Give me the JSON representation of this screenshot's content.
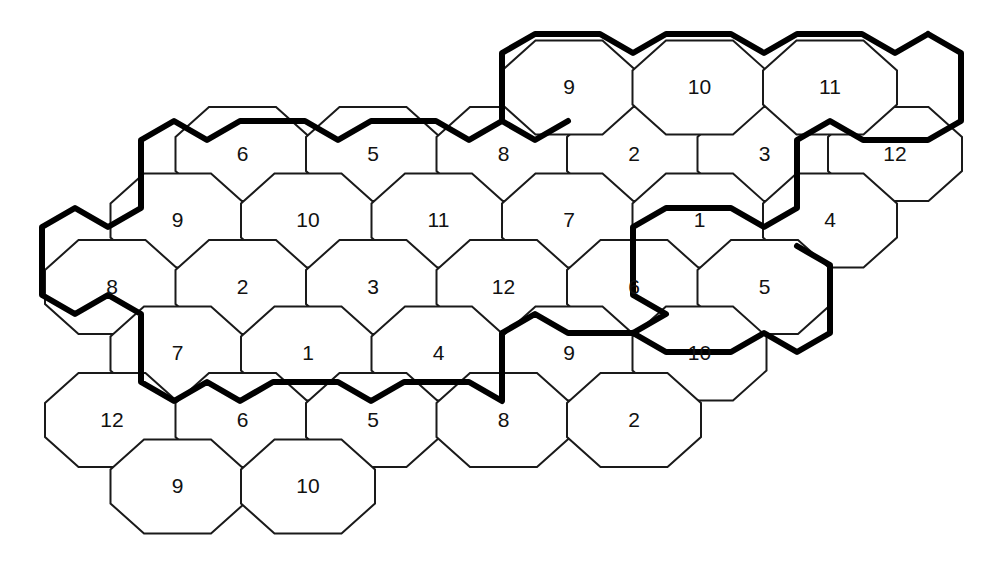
{
  "figure": {
    "name": "hexagonal-cell-grid",
    "background_color": "#ffffff",
    "thin_line_color": "#1a1a1a",
    "thick_line_color": "#000000",
    "label_color": "#111111",
    "thin_line_width": 2.0,
    "thick_line_width": 6.0,
    "hex": {
      "half_width": 67,
      "half_height": 47,
      "side_half_height": 17,
      "column_pitch": 130.5,
      "row_pitch": 133,
      "column_offset": 66.5
    },
    "origin": {
      "x": 112,
      "y": 287
    }
  },
  "cells": [
    {
      "id": "c-r0-q2",
      "label": "6",
      "col": 1,
      "row": -1,
      "cx": 242.5,
      "cy": 154.0
    },
    {
      "id": "c-r0-q3",
      "label": "5",
      "col": 2,
      "row": -1,
      "cx": 373.0,
      "cy": 154.0
    },
    {
      "id": "c-r0-q4",
      "label": "8",
      "col": 3,
      "row": -1,
      "cx": 503.5,
      "cy": 154.0
    },
    {
      "id": "c-r0-q5",
      "label": "2",
      "col": 4,
      "row": -1,
      "cx": 634.0,
      "cy": 154.0
    },
    {
      "id": "c-r0-q6",
      "label": "3",
      "col": 5,
      "row": -1,
      "cx": 764.5,
      "cy": 154.0
    },
    {
      "id": "c-r0-q7",
      "label": "12",
      "col": 6,
      "row": -1,
      "cx": 895.0,
      "cy": 154.0
    },
    {
      "id": "c-t-q4",
      "label": "9",
      "col": 3,
      "row": -2,
      "cx": 569.0,
      "cy": 87.5
    },
    {
      "id": "c-t-q5",
      "label": "10",
      "col": 4,
      "row": -2,
      "cx": 699.5,
      "cy": 87.5
    },
    {
      "id": "c-t-q6",
      "label": "11",
      "col": 5,
      "row": -2,
      "cx": 830.0,
      "cy": 87.5
    },
    {
      "id": "c-u-q1",
      "label": "9",
      "col": 0,
      "row": -1,
      "cx": 177.5,
      "cy": 220.5
    },
    {
      "id": "c-u-q2",
      "label": "10",
      "col": 1,
      "row": -1,
      "cx": 308.0,
      "cy": 220.5
    },
    {
      "id": "c-u-q3",
      "label": "11",
      "col": 2,
      "row": -1,
      "cx": 438.5,
      "cy": 220.5
    },
    {
      "id": "c-u-q4",
      "label": "7",
      "col": 3,
      "row": -1,
      "cx": 569.0,
      "cy": 220.5
    },
    {
      "id": "c-u-q5",
      "label": "1",
      "col": 4,
      "row": -1,
      "cx": 699.5,
      "cy": 220.5
    },
    {
      "id": "c-u-q6",
      "label": "4",
      "col": 5,
      "row": -1,
      "cx": 830.0,
      "cy": 220.5
    },
    {
      "id": "c-m-q0",
      "label": "8",
      "col": 0,
      "row": 0,
      "cx": 112.0,
      "cy": 287.0
    },
    {
      "id": "c-m-q1",
      "label": "2",
      "col": 1,
      "row": 0,
      "cx": 242.5,
      "cy": 287.0
    },
    {
      "id": "c-m-q2",
      "label": "3",
      "col": 2,
      "row": 0,
      "cx": 373.0,
      "cy": 287.0
    },
    {
      "id": "c-m-q3",
      "label": "12",
      "col": 3,
      "row": 0,
      "cx": 503.5,
      "cy": 287.0
    },
    {
      "id": "c-m-q4",
      "label": "6",
      "col": 4,
      "row": 0,
      "cx": 634.0,
      "cy": 287.0
    },
    {
      "id": "c-m-q5",
      "label": "5",
      "col": 5,
      "row": 0,
      "cx": 764.5,
      "cy": 287.0
    },
    {
      "id": "c-d-q0",
      "label": "7",
      "col": 0,
      "row": 1,
      "cx": 177.5,
      "cy": 353.5
    },
    {
      "id": "c-d-q1",
      "label": "1",
      "col": 1,
      "row": 1,
      "cx": 308.0,
      "cy": 353.5
    },
    {
      "id": "c-d-q2",
      "label": "4",
      "col": 2,
      "row": 1,
      "cx": 438.5,
      "cy": 353.5
    },
    {
      "id": "c-d-q3",
      "label": "9",
      "col": 3,
      "row": 1,
      "cx": 569.0,
      "cy": 353.5
    },
    {
      "id": "c-d-q4",
      "label": "10",
      "col": 4,
      "row": 1,
      "cx": 699.5,
      "cy": 353.5
    },
    {
      "id": "c-b-q0",
      "label": "12",
      "col": 0,
      "row": 2,
      "cx": 112.0,
      "cy": 420.0
    },
    {
      "id": "c-b-q1",
      "label": "6",
      "col": 1,
      "row": 2,
      "cx": 242.5,
      "cy": 420.0
    },
    {
      "id": "c-b-q2",
      "label": "5",
      "col": 2,
      "row": 2,
      "cx": 373.0,
      "cy": 420.0
    },
    {
      "id": "c-b-q3",
      "label": "8",
      "col": 3,
      "row": 2,
      "cx": 503.5,
      "cy": 420.0
    },
    {
      "id": "c-b-q4",
      "label": "2",
      "col": 4,
      "row": 2,
      "cx": 634.0,
      "cy": 420.0
    },
    {
      "id": "c-f-q1",
      "label": "9",
      "col": 1,
      "row": 3,
      "cx": 177.5,
      "cy": 486.5
    },
    {
      "id": "c-f-q2",
      "label": "10",
      "col": 2,
      "row": 3,
      "cx": 308.0,
      "cy": 486.5
    }
  ],
  "bold_boundary": {
    "name": "cluster-boundary",
    "description": "Heavy outline tracing the repeating 12-cell cluster pattern",
    "polylines": [
      [
        [
          928,
          34
        ],
        [
          895,
          53
        ],
        [
          862,
          34
        ],
        [
          797,
          34
        ],
        [
          764,
          53
        ],
        [
          731,
          34
        ],
        [
          666,
          34
        ],
        [
          633,
          53
        ],
        [
          600,
          34
        ],
        [
          535,
          34
        ],
        [
          502,
          53
        ],
        [
          502,
          121
        ],
        [
          469,
          140
        ],
        [
          436,
          121
        ],
        [
          371,
          121
        ],
        [
          338,
          140
        ],
        [
          305,
          121
        ],
        [
          240,
          121
        ],
        [
          207,
          140
        ],
        [
          174,
          121
        ],
        [
          141,
          140
        ],
        [
          141,
          208
        ],
        [
          108,
          227
        ],
        [
          75,
          208
        ],
        [
          42,
          227
        ],
        [
          42,
          295
        ],
        [
          75,
          314
        ],
        [
          108,
          295
        ],
        [
          141,
          314
        ],
        [
          141,
          382
        ],
        [
          174,
          401
        ],
        [
          207,
          382
        ],
        [
          240,
          401
        ],
        [
          273,
          382
        ],
        [
          338,
          382
        ],
        [
          371,
          401
        ],
        [
          404,
          382
        ],
        [
          469,
          382
        ],
        [
          502,
          401
        ],
        [
          502,
          333
        ],
        [
          535,
          314
        ],
        [
          568,
          333
        ],
        [
          633,
          333
        ],
        [
          666,
          314
        ],
        [
          633,
          295
        ],
        [
          633,
          227
        ],
        [
          666,
          208
        ],
        [
          731,
          208
        ],
        [
          764,
          227
        ],
        [
          797,
          208
        ],
        [
          797,
          140
        ],
        [
          830,
          121
        ],
        [
          863,
          140
        ],
        [
          928,
          140
        ],
        [
          961,
          121
        ],
        [
          961,
          53
        ],
        [
          928,
          34
        ]
      ],
      [
        [
          502,
          121
        ],
        [
          535,
          140
        ],
        [
          568,
          121
        ]
      ],
      [
        [
          633,
          333
        ],
        [
          666,
          352
        ],
        [
          731,
          352
        ],
        [
          764,
          333
        ],
        [
          797,
          352
        ],
        [
          830,
          333
        ],
        [
          830,
          265
        ],
        [
          797,
          246
        ]
      ]
    ]
  }
}
